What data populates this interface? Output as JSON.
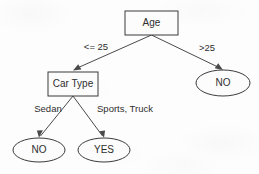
{
  "diagram": {
    "type": "decision-tree",
    "colors": {
      "background": "#fdfdfd",
      "node_fill": "#fcfcfc",
      "node_stroke": "#3b3b3b",
      "edge_stroke": "#4a4a4a",
      "text": "#2e2e2e"
    },
    "nodes": [
      {
        "id": "age",
        "label": "Age",
        "shape": "rectangle",
        "cx": 151.5,
        "cy": 23,
        "w": 53,
        "h": 24
      },
      {
        "id": "cartype",
        "label": "Car Type",
        "shape": "rectangle",
        "cx": 73,
        "cy": 84,
        "w": 50,
        "h": 24
      },
      {
        "id": "no_right",
        "label": "NO",
        "shape": "ellipse",
        "cx": 223,
        "cy": 83,
        "rx": 27,
        "ry": 13
      },
      {
        "id": "no_left",
        "label": "NO",
        "shape": "ellipse",
        "cx": 39,
        "cy": 150,
        "rx": 26,
        "ry": 12
      },
      {
        "id": "yes_leaf",
        "label": "YES",
        "shape": "ellipse",
        "cx": 104,
        "cy": 150,
        "rx": 26,
        "ry": 12
      }
    ],
    "edges": [
      {
        "id": "age-le25",
        "from": "age",
        "to": "cartype",
        "label": "<= 25",
        "label_x": 96,
        "label_y": 47
      },
      {
        "id": "age-gt25",
        "from": "age",
        "to": "no_right",
        "label": ">25",
        "label_x": 207,
        "label_y": 48
      },
      {
        "id": "cartype-sedan",
        "from": "cartype",
        "to": "no_left",
        "label": "Sedan",
        "label_x": 48,
        "label_y": 109
      },
      {
        "id": "cartype-sptruck",
        "from": "cartype",
        "to": "yes_leaf",
        "label": "Sports, Truck",
        "label_x": 125,
        "label_y": 109
      }
    ]
  }
}
